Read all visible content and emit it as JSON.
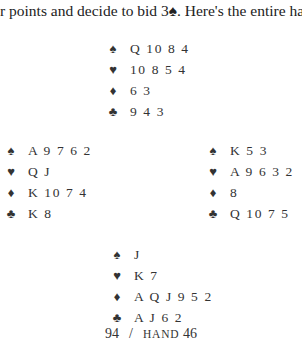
{
  "intro_text": "r points and decide to bid 3♠. Here's the entire hand:",
  "suit_symbols": {
    "spades": "♠",
    "hearts": "♥",
    "diamonds": "♦",
    "clubs": "♣"
  },
  "hands": {
    "north": {
      "spades": "Q 10 8 4",
      "hearts": "10 8 5 4",
      "diamonds": "6 3",
      "clubs": "9 4 3"
    },
    "west": {
      "spades": "A 9 7 6 2",
      "hearts": "Q J",
      "diamonds": "K 10 7 4",
      "clubs": "K 8"
    },
    "east": {
      "spades": "K 5 3",
      "hearts": "A 9 6 3 2",
      "diamonds": "8",
      "clubs": "Q 10 7 5"
    },
    "south": {
      "spades": "J",
      "hearts": "K 7",
      "diamonds": "A Q J 9 5 2",
      "clubs": "A J 6 2"
    }
  },
  "footer": {
    "page_number": "94",
    "separator": "/",
    "section_label": "HAND",
    "hand_number": "46"
  }
}
